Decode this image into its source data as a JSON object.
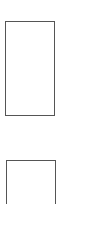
{
  "thumbnails": [
    {
      "index": 1,
      "border_color": "#555555"
    },
    {
      "index": 2,
      "border_color": "#555555"
    }
  ],
  "background": "#ffffff"
}
